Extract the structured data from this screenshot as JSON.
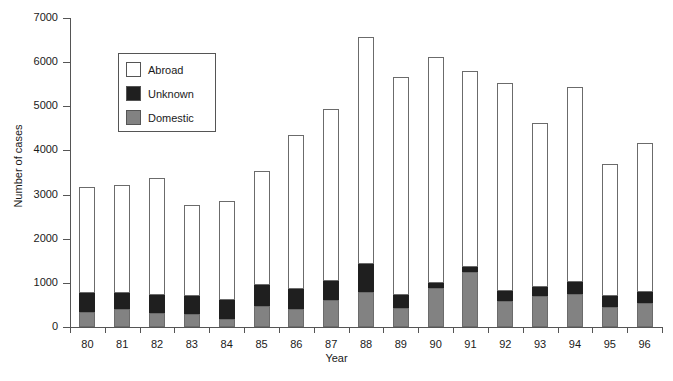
{
  "chart_data": {
    "type": "bar",
    "title": "",
    "subtitle": "",
    "xlabel": "Year",
    "ylabel": "Number of cases",
    "stacked": true,
    "grid": false,
    "legend_position": "inside-upper-left",
    "ylim": [
      0,
      7000
    ],
    "ytick_labels": [
      "0",
      "1000",
      "2000",
      "3000",
      "4000",
      "5000",
      "6000",
      "7000"
    ],
    "ytick_values": [
      0,
      1000,
      2000,
      3000,
      4000,
      5000,
      6000,
      7000
    ],
    "categories": [
      "80",
      "81",
      "82",
      "83",
      "84",
      "85",
      "86",
      "87",
      "88",
      "89",
      "90",
      "91",
      "92",
      "93",
      "94",
      "95",
      "96"
    ],
    "series": [
      {
        "name": "Domestic",
        "color": "#828282",
        "values": [
          350,
          410,
          320,
          300,
          180,
          480,
          400,
          620,
          800,
          420,
          880,
          1250,
          580,
          700,
          740,
          460,
          540
        ]
      },
      {
        "name": "Unknown",
        "color": "#1f1f1f",
        "values": [
          430,
          370,
          400,
          400,
          430,
          470,
          460,
          430,
          620,
          300,
          120,
          110,
          230,
          210,
          290,
          240,
          250
        ]
      },
      {
        "name": "Abroad",
        "color": "#ffffff",
        "values": [
          2390,
          2440,
          2650,
          2070,
          2250,
          2590,
          3500,
          3900,
          5150,
          4950,
          5110,
          4440,
          4720,
          3720,
          4400,
          3000,
          3370
        ]
      }
    ],
    "totals": [
      3170,
      3220,
      3370,
      2770,
      2860,
      3540,
      4360,
      4950,
      6570,
      5670,
      6110,
      5800,
      5530,
      4630,
      5430,
      3700,
      4160
    ]
  },
  "legend": {
    "items": [
      {
        "label": "Abroad",
        "color": "#ffffff",
        "swatch_class": "seg-abroad"
      },
      {
        "label": "Unknown",
        "color": "#1f1f1f",
        "swatch_class": "seg-unknown"
      },
      {
        "label": "Domestic",
        "color": "#828282",
        "swatch_class": "seg-domestic"
      }
    ]
  },
  "colors": {
    "axis": "#555555",
    "text": "#1a1a1a",
    "background": "#ffffff"
  }
}
